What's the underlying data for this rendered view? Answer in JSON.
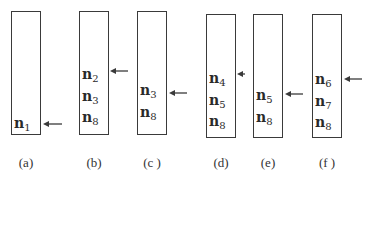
{
  "diagram": {
    "panels": [
      {
        "id": "a",
        "caption": "(a)",
        "box": {
          "x": 11,
          "y": 11,
          "w": 30,
          "h": 124
        },
        "nodes": [
          {
            "base": "n",
            "sub": "1",
            "y": 116
          }
        ],
        "arrow": {
          "x1": 62,
          "x2": 43,
          "y": 124
        }
      },
      {
        "id": "b",
        "caption": "(b)",
        "box": {
          "x": 79,
          "y": 11,
          "w": 30,
          "h": 124
        },
        "nodes": [
          {
            "base": "n",
            "sub": "2",
            "y": 67
          },
          {
            "base": "n",
            "sub": "3",
            "y": 89
          },
          {
            "base": "n",
            "sub": "8",
            "y": 110
          }
        ],
        "arrow": {
          "x1": 128,
          "x2": 110,
          "y": 71
        }
      },
      {
        "id": "c",
        "caption": "(c )",
        "box": {
          "x": 137,
          "y": 11,
          "w": 30,
          "h": 124
        },
        "nodes": [
          {
            "base": "n",
            "sub": "3",
            "y": 83
          },
          {
            "base": "n",
            "sub": "8",
            "y": 105
          }
        ],
        "arrow": {
          "x1": 187,
          "x2": 169,
          "y": 93
        }
      },
      {
        "id": "d",
        "caption": "(d)",
        "box": {
          "x": 206,
          "y": 14,
          "w": 30,
          "h": 124
        },
        "nodes": [
          {
            "base": "n",
            "sub": "4",
            "y": 71
          },
          {
            "base": "n",
            "sub": "5",
            "y": 93
          },
          {
            "base": "n",
            "sub": "8",
            "y": 114
          }
        ],
        "arrow": {
          "x1": 245,
          "x2": 237,
          "y": 74
        }
      },
      {
        "id": "e",
        "caption": "(e)",
        "box": {
          "x": 253,
          "y": 14,
          "w": 30,
          "h": 124
        },
        "nodes": [
          {
            "base": "n",
            "sub": "5",
            "y": 88
          },
          {
            "base": "n",
            "sub": "8",
            "y": 110
          }
        ],
        "arrow": {
          "x1": 303,
          "x2": 285,
          "y": 94
        }
      },
      {
        "id": "f",
        "caption": "(f )",
        "box": {
          "x": 312,
          "y": 14,
          "w": 30,
          "h": 124
        },
        "nodes": [
          {
            "base": "n",
            "sub": "6",
            "y": 72
          },
          {
            "base": "n",
            "sub": "7",
            "y": 94
          },
          {
            "base": "n",
            "sub": "8",
            "y": 115
          }
        ],
        "arrow": {
          "x1": 362,
          "x2": 344,
          "y": 79
        }
      }
    ],
    "caption_y": 155,
    "colors": {
      "stroke": "#3a3a3a",
      "text": "#2a2a2a",
      "background": "#ffffff"
    }
  }
}
